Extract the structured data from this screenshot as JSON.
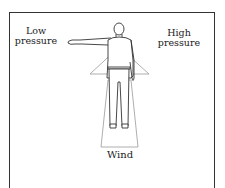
{
  "diagram": {
    "labels": {
      "low_line1": "Low",
      "low_line2": "pressure",
      "high_line1": "High",
      "high_line2": "pressure",
      "wind": "Wind"
    },
    "elements": [
      "standing person with left arm pointing toward low pressure",
      "triangle behind torso",
      "trapezoid behind legs indicating wind direction"
    ],
    "colors": {
      "line": "#333333",
      "shape_outline": "#999999",
      "background": "#ffffff"
    }
  }
}
